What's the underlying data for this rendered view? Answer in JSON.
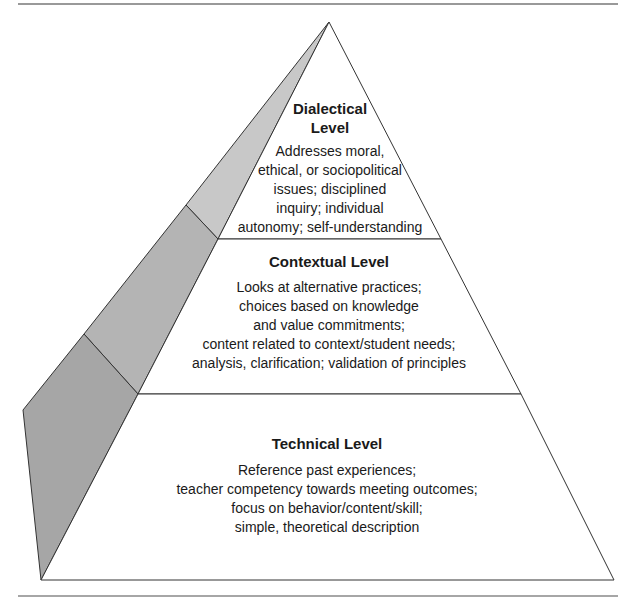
{
  "diagram": {
    "type": "pyramid",
    "levels": [
      {
        "title_lines": [
          "Dialectical",
          "Level"
        ],
        "description_lines": [
          "Addresses moral,",
          "ethical, or sociopolitical",
          "issues; disciplined",
          "inquiry; individual",
          "autonomy; self-understanding"
        ]
      },
      {
        "title_lines": [
          "Contextual Level"
        ],
        "description_lines": [
          "Looks at alternative practices;",
          "choices based on knowledge",
          "and value commitments;",
          "content related to context/student needs;",
          "analysis, clarification; validation of principles"
        ]
      },
      {
        "title_lines": [
          "Technical Level"
        ],
        "description_lines": [
          "Reference past experiences;",
          "teacher competency towards meeting outcomes;",
          "focus on behavior/content/skill;",
          "simple, theoretical description"
        ]
      }
    ],
    "colors": {
      "stroke": "#333333",
      "face": "#ffffff",
      "side_top": "#c8c8c8",
      "side_middle": "#b4b4b4",
      "side_bottom": "#a6a6a6",
      "rule": "#777777"
    }
  }
}
